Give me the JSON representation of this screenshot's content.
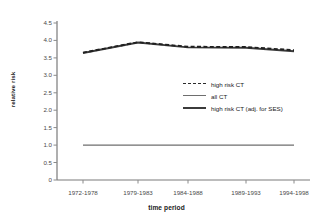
{
  "chart_data": {
    "type": "line",
    "title": "",
    "xlabel": "time period",
    "ylabel": "relative risk",
    "categories": [
      "1972-1978",
      "1979-1983",
      "1984-1988",
      "1989-1993",
      "1994-1998"
    ],
    "yticks": [
      "0",
      "0.5",
      "1.0",
      "1.5",
      "2.0",
      "2.5",
      "3.0",
      "3.5",
      "4.0",
      "4.5"
    ],
    "ylim": [
      0,
      4.5
    ],
    "grid": false,
    "legend_position": "center-right",
    "series": [
      {
        "name": "high risk CT",
        "style": "dashed",
        "color": "#2b2b2b",
        "values": [
          3.65,
          3.95,
          3.82,
          3.81,
          3.72
        ]
      },
      {
        "name": "all CT",
        "style": "solid-thin",
        "color": "#6e6e6e",
        "values": [
          1.0,
          1.0,
          1.0,
          1.0,
          1.0
        ]
      },
      {
        "name": "high risk CT (adj. for SES)",
        "style": "solid",
        "color": "#3b3b3b",
        "values": [
          3.64,
          3.94,
          3.8,
          3.79,
          3.69
        ]
      }
    ]
  },
  "axes": {
    "y_title": "relative risk",
    "x_title": "time period"
  }
}
